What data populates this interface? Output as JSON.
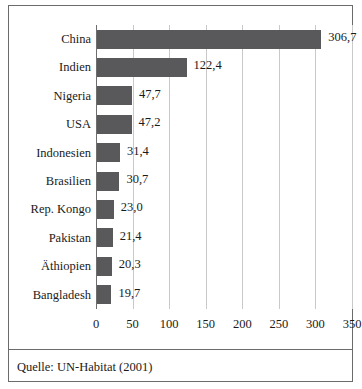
{
  "figure": {
    "source_note": "Quelle: UN-Habitat (2001)",
    "frame_color": "#6b6b6b",
    "bar_color": "#59595b",
    "gridline_color": "#c9c9c9",
    "axis_color": "#6e6e6e",
    "background": "#ffffff"
  },
  "chart_data": {
    "type": "bar",
    "orientation": "horizontal",
    "title": "",
    "subtitle": "",
    "xlabel": "",
    "ylabel": "",
    "xlim": [
      0,
      350
    ],
    "grid": true,
    "legend": false,
    "legend_position": "none",
    "decimal_separator": ",",
    "categories": [
      "China",
      "Indien",
      "Nigeria",
      "USA",
      "Indonesien",
      "Brasilien",
      "Rep. Kongo",
      "Pakistan",
      "Äthiopien",
      "Bangladesh"
    ],
    "values": [
      306.7,
      122.4,
      47.7,
      47.2,
      31.4,
      30.7,
      23.0,
      21.4,
      20.3,
      19.7
    ],
    "value_labels": [
      "306,7",
      "122,4",
      "47,7",
      "47,2",
      "31,4",
      "30,7",
      "23,0",
      "21,4",
      "20,3",
      "19,7"
    ],
    "xticks": [
      0,
      50,
      100,
      150,
      200,
      250,
      300,
      350
    ],
    "xtick_labels": [
      "0",
      "50",
      "100",
      "150",
      "200",
      "250",
      "300",
      "350"
    ]
  }
}
